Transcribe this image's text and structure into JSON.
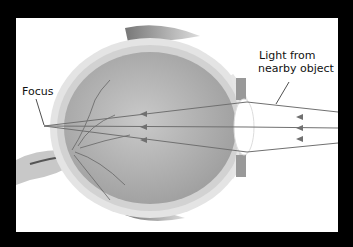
{
  "diagram": {
    "labels": {
      "focus": "Focus",
      "light_line1": "Light from",
      "light_line2": "nearby object"
    },
    "colors": {
      "background": "#000000",
      "panel": "#ffffff",
      "ray": "#707070",
      "eyeball": "#b8b8b8",
      "lens": "#ffffff"
    },
    "rays": [
      {
        "entry": [
          338,
          112
        ],
        "lens": [
          247,
          102
        ],
        "focus": [
          44,
          126
        ]
      },
      {
        "entry": [
          338,
          128
        ],
        "lens": [
          247,
          127
        ],
        "focus": [
          44,
          126
        ]
      },
      {
        "entry": [
          338,
          143
        ],
        "lens": [
          247,
          152
        ],
        "focus": [
          44,
          126
        ]
      }
    ]
  }
}
